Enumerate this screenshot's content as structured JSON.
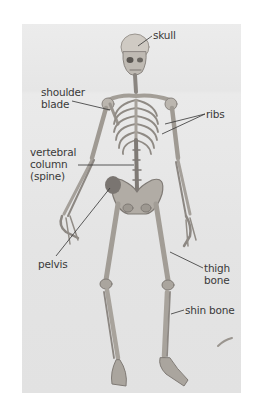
{
  "diagram": {
    "type": "labeled-anatomy-photo",
    "colors": {
      "background": "#ffffff",
      "photo_bg": "#e6e6e6",
      "bone": "#b9b4ad",
      "bone_shade": "#8a8580",
      "label_text": "#3a3a3a",
      "leader_line": "#333333"
    },
    "labels": [
      {
        "id": "skull",
        "text": "skull"
      },
      {
        "id": "shoulder_blade",
        "lines": [
          "shoulder",
          "blade"
        ]
      },
      {
        "id": "ribs",
        "text": "ribs"
      },
      {
        "id": "vertebral_column",
        "lines": [
          "vertebral",
          "column",
          "(spine)"
        ]
      },
      {
        "id": "pelvis",
        "text": "pelvis"
      },
      {
        "id": "thigh_bone",
        "lines": [
          "thigh",
          "bone"
        ]
      },
      {
        "id": "shin_bone",
        "text": "shin bone"
      }
    ]
  }
}
